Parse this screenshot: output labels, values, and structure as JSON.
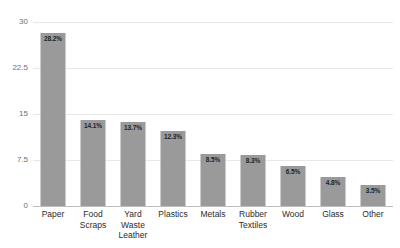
{
  "chart_data": {
    "type": "bar",
    "title": "",
    "xlabel": "",
    "ylabel": "",
    "ylim": [
      0,
      30
    ],
    "yticks": [
      "0",
      "7.5",
      "15",
      "22.5",
      "30"
    ],
    "grid": true,
    "legend": false,
    "bar_color": "#9a9a9a",
    "categories": [
      "Paper",
      "Food Scraps",
      "Yard Waste Leather",
      "Plastics",
      "Metals",
      "Rubber Textiles",
      "Wood",
      "Glass",
      "Other"
    ],
    "category_lines": [
      [
        "Paper",
        ""
      ],
      [
        "Food",
        "Scraps"
      ],
      [
        "Yard Waste",
        "Leather"
      ],
      [
        "Plastics",
        ""
      ],
      [
        "Metals",
        ""
      ],
      [
        "Rubber",
        "Textiles"
      ],
      [
        "Wood",
        ""
      ],
      [
        "Glass",
        ""
      ],
      [
        "Other",
        ""
      ]
    ],
    "values": [
      28.2,
      14.1,
      13.7,
      12.3,
      8.5,
      8.3,
      6.5,
      4.8,
      3.5
    ],
    "data_labels": [
      "28.2%",
      "14.1%",
      "13.7%",
      "12.3%",
      "8.5%",
      "8.3%",
      "6.5%",
      "4.8%",
      "3.5%"
    ]
  }
}
